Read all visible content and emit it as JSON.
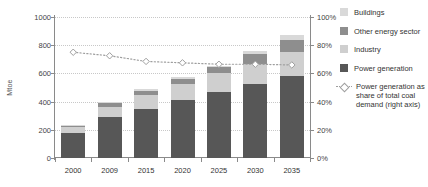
{
  "axes": {
    "ylabel": "Mtoe",
    "y_ticks": [
      "0",
      "200",
      "400",
      "600",
      "800",
      "1000"
    ],
    "y2_ticks": [
      "0%",
      "20%",
      "40%",
      "60%",
      "80%",
      "100%"
    ],
    "x_ticks": [
      "2000",
      "2009",
      "2015",
      "2020",
      "2025",
      "2030",
      "2035"
    ]
  },
  "legend": {
    "items": [
      {
        "label": "Buildings",
        "color": "#d9d9d9",
        "icon": "color-swatch"
      },
      {
        "label": "Other energy sector",
        "color": "#8e8e8e",
        "icon": "color-swatch"
      },
      {
        "label": "Industry",
        "color": "#cfcfcf",
        "icon": "color-swatch"
      },
      {
        "label": "Power generation",
        "color": "#575757",
        "icon": "color-swatch"
      }
    ],
    "series_label": "Power generation as share of total coal demand (right axis)",
    "series_icon": "dotted-line-diamond-marker",
    "series_color": "#9e9e9e"
  },
  "chart_data": {
    "type": "bar",
    "title": "",
    "xlabel": "",
    "ylabel": "Mtoe",
    "y2label": "Power generation as share of total coal demand (right axis)",
    "ylim": [
      0,
      1000
    ],
    "y2lim": [
      0,
      100
    ],
    "grid": true,
    "legend_position": "right",
    "stacked": true,
    "categories": [
      "2000",
      "2009",
      "2015",
      "2020",
      "2025",
      "2030",
      "2035"
    ],
    "series": [
      {
        "name": "Power generation",
        "color": "#575757",
        "values": [
          175,
          290,
          350,
          415,
          470,
          525,
          585
        ]
      },
      {
        "name": "Industry",
        "color": "#cfcfcf",
        "values": [
          45,
          75,
          95,
          110,
          130,
          145,
          165
        ]
      },
      {
        "name": "Other energy sector",
        "color": "#8e8e8e",
        "values": [
          10,
          22,
          30,
          38,
          45,
          70,
          85
        ]
      },
      {
        "name": "Buildings",
        "color": "#d9d9d9",
        "values": [
          5,
          13,
          15,
          12,
          10,
          20,
          35
        ]
      }
    ],
    "totals": [
      235,
      400,
      490,
      575,
      655,
      760,
      870
    ],
    "line_series": {
      "name": "Power generation as share of total coal demand (right axis)",
      "color": "#9e9e9e",
      "axis": "right",
      "marker": "diamond",
      "linestyle": "dotted",
      "values": [
        75,
        72.5,
        68.5,
        67.5,
        66.5,
        66.5,
        66.0
      ]
    }
  }
}
